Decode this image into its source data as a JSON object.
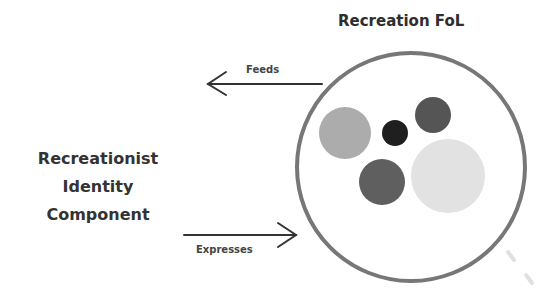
{
  "diagram": {
    "title": "Recreation FoL",
    "identity_label": [
      "Recreationist",
      "Identity",
      "Component"
    ],
    "arrows": {
      "feeds": {
        "label": "Feeds",
        "direction": "left"
      },
      "expresses": {
        "label": "Expresses",
        "direction": "right"
      }
    },
    "container_circle": {
      "cx": 411,
      "cy": 167,
      "r": 114,
      "stroke": "#777777"
    },
    "inner_circles": [
      {
        "cx": 345,
        "cy": 133,
        "r": 26,
        "fill": "#acacac"
      },
      {
        "cx": 395,
        "cy": 133,
        "r": 13,
        "fill": "#1f1f1f"
      },
      {
        "cx": 433,
        "cy": 115,
        "r": 18,
        "fill": "#555555"
      },
      {
        "cx": 382,
        "cy": 182,
        "r": 23,
        "fill": "#5f5f5f"
      },
      {
        "cx": 448,
        "cy": 176,
        "r": 37,
        "fill": "#e2e2e2"
      }
    ]
  }
}
